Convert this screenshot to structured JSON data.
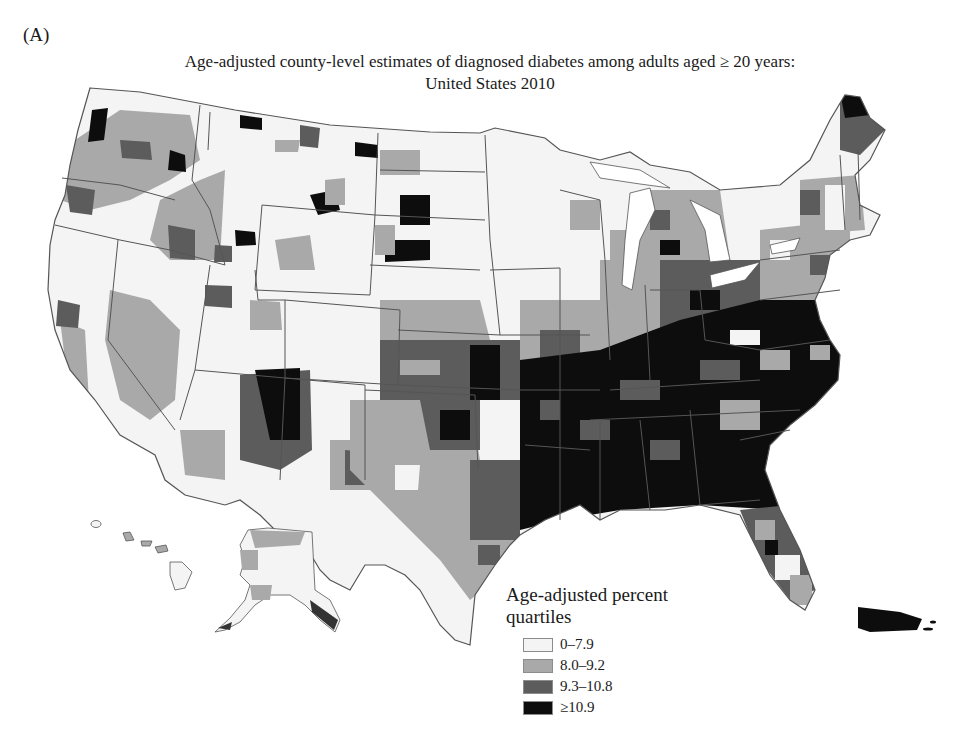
{
  "panel_label": "(A)",
  "title": {
    "line1": "Age-adjusted county-level estimates of diagnosed diabetes among adults aged ≥ 20 years:",
    "line2": "United States 2010"
  },
  "legend": {
    "title_line1": "Age-adjusted percent",
    "title_line2": "quartiles",
    "items": [
      {
        "label": "0–7.9",
        "color": "#f4f4f4"
      },
      {
        "label": "8.0–9.2",
        "color": "#a9a9a9"
      },
      {
        "label": "9.3–10.8",
        "color": "#5c5c5c"
      },
      {
        "label": "≥10.9",
        "color": "#0d0d0d"
      }
    ]
  },
  "map": {
    "region": "United States",
    "year": "2010",
    "measure": "Diagnosed diabetes, age-adjusted percent, adults aged ≥ 20",
    "insets": [
      "Alaska",
      "Hawaii",
      "Puerto Rico"
    ],
    "colors": {
      "q1": "#f4f4f4",
      "q2": "#a9a9a9",
      "q3": "#5c5c5c",
      "q4": "#0d0d0d",
      "border": "#555555",
      "background": "#ffffff"
    }
  }
}
